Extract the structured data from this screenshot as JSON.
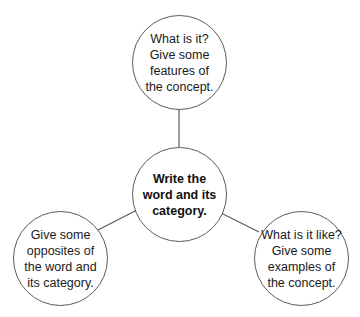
{
  "diagram": {
    "type": "concept-map",
    "colors": {
      "stroke": "#5a5a5a",
      "text": "#1a1a1a",
      "background": "#ffffff"
    },
    "center": {
      "text": "Write the word and its category."
    },
    "nodes": [
      {
        "id": "top",
        "text": "What is it? Give some features of the concept."
      },
      {
        "id": "bottom-left",
        "text": "Give some opposites of the word and its category."
      },
      {
        "id": "bottom-right",
        "text": "What is it like? Give some examples of the concept."
      }
    ],
    "edges": [
      {
        "from": "center",
        "to": "top"
      },
      {
        "from": "center",
        "to": "bottom-left"
      },
      {
        "from": "center",
        "to": "bottom-right"
      }
    ]
  }
}
